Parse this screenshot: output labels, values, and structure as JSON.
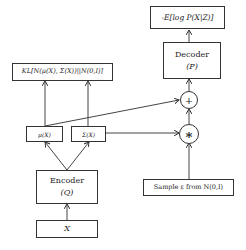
{
  "diagram": {
    "nodes": {
      "loss_recon": "-E[log P(X|Z)]",
      "decoder_title": "Decoder",
      "decoder_sub": "(P)",
      "kl_loss": "KL[N(μ(X), Σ(X))||N(0,I)]",
      "plus": "+",
      "mult": "∗",
      "mu": "μ(X)",
      "sigma": "Σ(X)",
      "encoder_title": "Encoder",
      "encoder_sub": "(Q)",
      "input": "X",
      "sample": "Sample ε from N(0,I)"
    },
    "edges": [
      {
        "from": "input",
        "to": "encoder"
      },
      {
        "from": "encoder",
        "to": "mu"
      },
      {
        "from": "encoder",
        "to": "sigma"
      },
      {
        "from": "mu",
        "to": "kl_loss"
      },
      {
        "from": "sigma",
        "to": "kl_loss"
      },
      {
        "from": "mu",
        "to": "plus"
      },
      {
        "from": "sigma",
        "to": "mult"
      },
      {
        "from": "sample",
        "to": "mult"
      },
      {
        "from": "mult",
        "to": "plus"
      },
      {
        "from": "plus",
        "to": "decoder"
      },
      {
        "from": "decoder",
        "to": "loss_recon"
      }
    ]
  }
}
